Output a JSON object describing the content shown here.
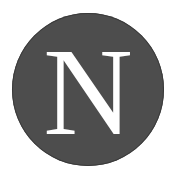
{
  "logo": {
    "letter": "N",
    "circle_color": "#4d4d4d",
    "letter_color": "#ffffff",
    "background": "#ffffff"
  }
}
